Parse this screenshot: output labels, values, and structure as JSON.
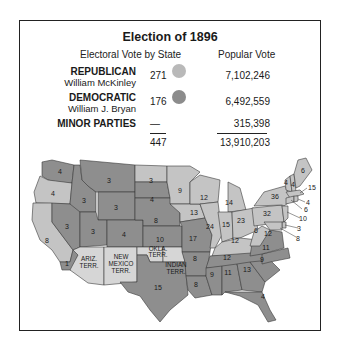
{
  "title": "Election of 1896",
  "headers": {
    "electoral": "Electoral Vote by State",
    "popular": "Popular Vote"
  },
  "legend": [
    {
      "party": "REPUBLICAN",
      "candidate": "William McKinley",
      "electoral": "271",
      "popular": "7,102,246",
      "color": "#b9b9b9"
    },
    {
      "party": "DEMOCRATIC",
      "candidate": "William J. Bryan",
      "electoral": "176",
      "popular": "6,492,559",
      "color": "#8c8c8c"
    },
    {
      "party": "MINOR PARTIES",
      "candidate": "",
      "electoral": "—",
      "popular": "315,398"
    }
  ],
  "totals": {
    "electoral": "447",
    "popular": "13,910,203"
  },
  "colors": {
    "republican": "#c4c4c4",
    "democratic": "#8e8e8e",
    "territory": "#d6d6d6",
    "border": "#333333",
    "water": "#ffffff"
  },
  "map": {
    "states": [
      {
        "id": "WA",
        "ev": "4",
        "party": "D"
      },
      {
        "id": "OR",
        "ev": "4",
        "party": "R"
      },
      {
        "id": "CA",
        "ev": "8",
        "party": "R"
      },
      {
        "id": "CA-split",
        "ev": "1",
        "party": "D"
      },
      {
        "id": "ID",
        "ev": "3",
        "party": "D"
      },
      {
        "id": "NV",
        "ev": "3",
        "party": "D"
      },
      {
        "id": "MT",
        "ev": "3",
        "party": "D"
      },
      {
        "id": "WY",
        "ev": "3",
        "party": "D"
      },
      {
        "id": "UT",
        "ev": "3",
        "party": "D"
      },
      {
        "id": "CO",
        "ev": "4",
        "party": "D"
      },
      {
        "id": "ND",
        "ev": "3",
        "party": "R"
      },
      {
        "id": "SD",
        "ev": "4",
        "party": "D"
      },
      {
        "id": "NE",
        "ev": "8",
        "party": "D"
      },
      {
        "id": "KS",
        "ev": "10",
        "party": "D"
      },
      {
        "id": "TX",
        "ev": "15",
        "party": "D"
      },
      {
        "id": "MN",
        "ev": "9",
        "party": "R"
      },
      {
        "id": "IA",
        "ev": "13",
        "party": "R"
      },
      {
        "id": "MO",
        "ev": "17",
        "party": "D"
      },
      {
        "id": "AR",
        "ev": "8",
        "party": "D"
      },
      {
        "id": "LA",
        "ev": "8",
        "party": "D"
      },
      {
        "id": "WI",
        "ev": "12",
        "party": "R"
      },
      {
        "id": "IL",
        "ev": "24",
        "party": "R"
      },
      {
        "id": "MI",
        "ev": "14",
        "party": "R"
      },
      {
        "id": "IN",
        "ev": "15",
        "party": "R"
      },
      {
        "id": "OH",
        "ev": "23",
        "party": "R"
      },
      {
        "id": "KY",
        "ev": "12",
        "party": "R"
      },
      {
        "id": "TN",
        "ev": "12",
        "party": "D"
      },
      {
        "id": "MS",
        "ev": "9",
        "party": "D"
      },
      {
        "id": "AL",
        "ev": "11",
        "party": "D"
      },
      {
        "id": "GA",
        "ev": "13",
        "party": "D"
      },
      {
        "id": "FL",
        "ev": "4",
        "party": "D"
      },
      {
        "id": "SC",
        "ev": "9",
        "party": "D"
      },
      {
        "id": "NC",
        "ev": "11",
        "party": "D"
      },
      {
        "id": "VA",
        "ev": "12",
        "party": "D"
      },
      {
        "id": "WV",
        "ev": "6",
        "party": "R"
      },
      {
        "id": "PA",
        "ev": "32",
        "party": "R"
      },
      {
        "id": "NY",
        "ev": "36",
        "party": "R"
      },
      {
        "id": "VT",
        "ev": "4",
        "party": "R"
      },
      {
        "id": "NH",
        "ev": "4",
        "party": "R"
      },
      {
        "id": "ME",
        "ev": "6",
        "party": "R"
      },
      {
        "id": "MA",
        "ev": "15",
        "party": "R"
      },
      {
        "id": "RI",
        "ev": "4",
        "party": "R"
      },
      {
        "id": "CT",
        "ev": "6",
        "party": "R"
      },
      {
        "id": "NJ",
        "ev": "10",
        "party": "R"
      },
      {
        "id": "DE",
        "ev": "3",
        "party": "R"
      },
      {
        "id": "MD",
        "ev": "8",
        "party": "R"
      }
    ],
    "territories": [
      {
        "id": "AZ",
        "label": [
          "ARIZ.",
          "TERR."
        ]
      },
      {
        "id": "NM",
        "label": [
          "NEW",
          "MEXICO",
          "TERR."
        ]
      },
      {
        "id": "OK",
        "label": [
          "OKLA.",
          "TERR."
        ]
      },
      {
        "id": "IT",
        "label": [
          "INDIAN",
          "TERR."
        ]
      }
    ]
  }
}
